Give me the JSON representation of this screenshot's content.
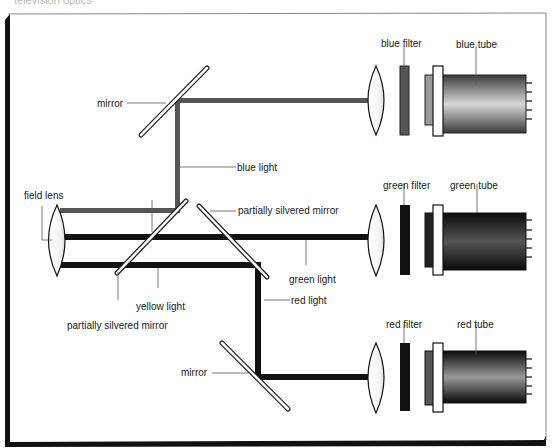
{
  "caption_partial": "television optics",
  "diagram": {
    "labels": {
      "mirror_top": "mirror",
      "blue_light": "blue light",
      "field_lens": "field lens",
      "partially_silvered_mirror_right": "partially silvered mirror",
      "green_light": "green light",
      "red_light": "red light",
      "yellow_light": "yellow light",
      "partially_silvered_mirror_left": "partially silvered mirror",
      "mirror_bottom": "mirror",
      "blue_filter": "blue filter",
      "blue_tube": "blue tube",
      "green_filter": "green filter",
      "green_tube": "green tube",
      "red_filter": "red filter",
      "red_tube": "red tube"
    },
    "colors": {
      "beam_dark": "#111111",
      "beam_gray": "#555555",
      "frame": "#111111",
      "label_text": "#222222"
    }
  }
}
